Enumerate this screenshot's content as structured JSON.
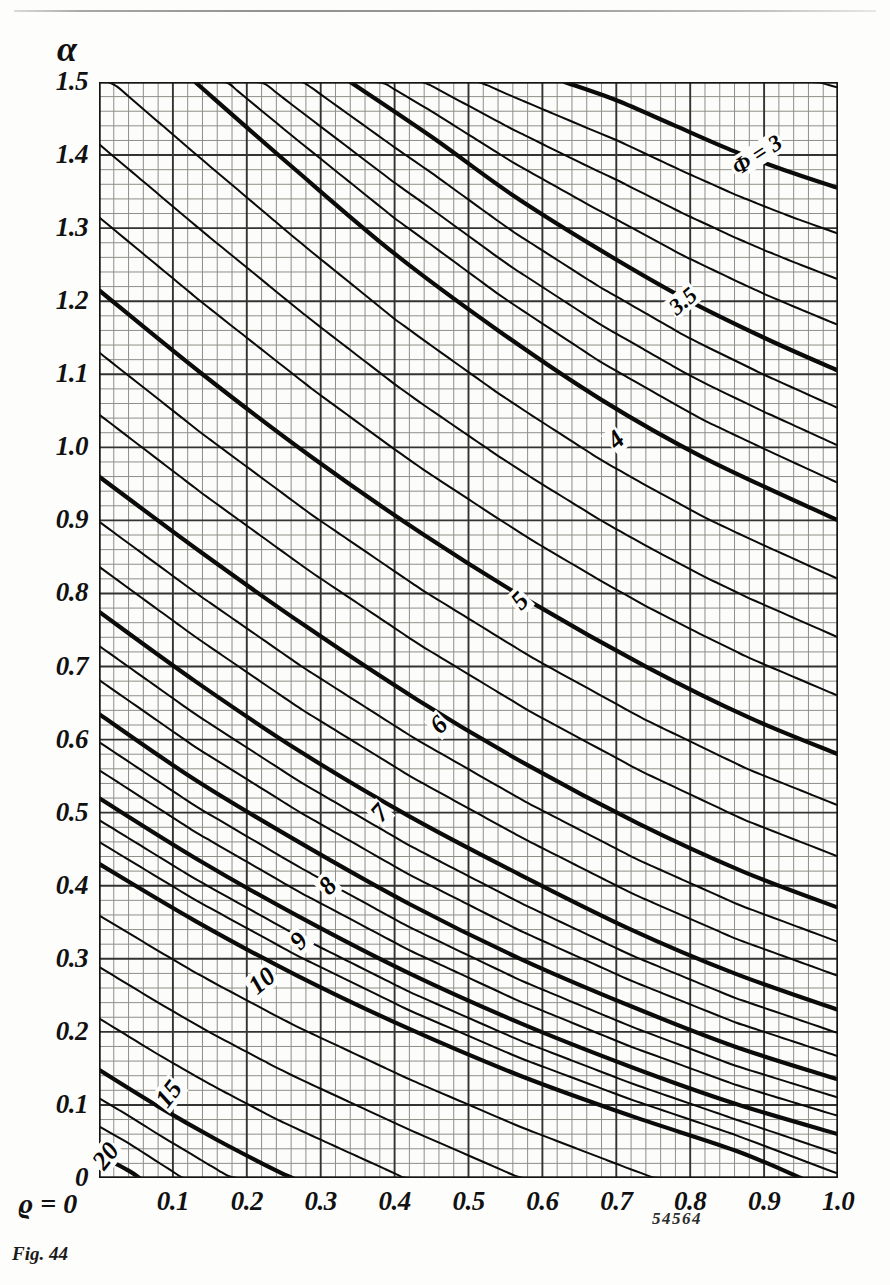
{
  "figure": {
    "caption": "Fig. 44",
    "serial_number": "54564"
  },
  "axes": {
    "y_symbol": "α",
    "x_symbol": "ϱ = 0",
    "x_label_prefix": "ϱ =",
    "y_ticks": [
      "0",
      "0.1",
      "0.2",
      "0.3",
      "0.4",
      "0.5",
      "0.6",
      "0.7",
      "0.8",
      "0.9",
      "1.0",
      "1.1",
      "1.2",
      "1.3",
      "1.4",
      "1.5"
    ],
    "x_ticks": [
      "0",
      "0.1",
      "0.2",
      "0.3",
      "0.4",
      "0.5",
      "0.6",
      "0.7",
      "0.8",
      "0.9",
      "1.0"
    ]
  },
  "chart_data": {
    "type": "line",
    "title": "Fig. 44",
    "xlabel": "ϱ",
    "ylabel": "α",
    "xlim": [
      0,
      1.0
    ],
    "ylim": [
      0,
      1.5
    ],
    "grid": true,
    "minor_grid": true,
    "minor_per_major": 5,
    "legend": "none",
    "contour_variable": "Φ",
    "annotations": [
      {
        "text": "Φ = 3",
        "x": 0.89,
        "y": 1.4,
        "rotation": -33
      },
      {
        "text": "3.5",
        "x": 0.79,
        "y": 1.2,
        "rotation": -40
      },
      {
        "text": "4",
        "x": 0.7,
        "y": 1.01,
        "rotation": -42
      },
      {
        "text": "5",
        "x": 0.57,
        "y": 0.79,
        "rotation": -45
      },
      {
        "text": "6",
        "x": 0.46,
        "y": 0.62,
        "rotation": -45
      },
      {
        "text": "7",
        "x": 0.38,
        "y": 0.5,
        "rotation": -48
      },
      {
        "text": "8",
        "x": 0.31,
        "y": 0.4,
        "rotation": -48
      },
      {
        "text": "9",
        "x": 0.27,
        "y": 0.325,
        "rotation": -48
      },
      {
        "text": "10",
        "x": 0.22,
        "y": 0.27,
        "rotation": -40
      },
      {
        "text": "15",
        "x": 0.095,
        "y": 0.115,
        "rotation": -52
      },
      {
        "text": "20",
        "x": 0.01,
        "y": 0.03,
        "rotation": -52
      }
    ],
    "labeled_contours": [
      {
        "label": "Φ = 3",
        "phi": 3,
        "points": [
          [
            0.63,
            1.5
          ],
          [
            0.7,
            1.475
          ],
          [
            0.78,
            1.44
          ],
          [
            0.86,
            1.405
          ],
          [
            0.94,
            1.375
          ],
          [
            1.0,
            1.355
          ]
        ]
      },
      {
        "label": "3.5",
        "phi": 3.5,
        "points": [
          [
            0.34,
            1.5
          ],
          [
            0.45,
            1.425
          ],
          [
            0.56,
            1.345
          ],
          [
            0.67,
            1.275
          ],
          [
            0.79,
            1.205
          ],
          [
            0.9,
            1.15
          ],
          [
            1.0,
            1.105
          ]
        ]
      },
      {
        "label": "4",
        "phi": 4,
        "points": [
          [
            0.13,
            1.5
          ],
          [
            0.26,
            1.385
          ],
          [
            0.4,
            1.265
          ],
          [
            0.54,
            1.16
          ],
          [
            0.68,
            1.065
          ],
          [
            0.82,
            0.985
          ],
          [
            1.0,
            0.9
          ]
        ]
      },
      {
        "label": "5",
        "phi": 5,
        "points": [
          [
            0.0,
            1.215
          ],
          [
            0.14,
            1.1
          ],
          [
            0.29,
            0.985
          ],
          [
            0.44,
            0.88
          ],
          [
            0.59,
            0.785
          ],
          [
            0.74,
            0.7
          ],
          [
            0.88,
            0.63
          ],
          [
            1.0,
            0.58
          ]
        ]
      },
      {
        "label": "6",
        "phi": 6,
        "points": [
          [
            0.0,
            0.96
          ],
          [
            0.14,
            0.855
          ],
          [
            0.28,
            0.755
          ],
          [
            0.43,
            0.655
          ],
          [
            0.58,
            0.565
          ],
          [
            0.73,
            0.485
          ],
          [
            0.87,
            0.42
          ],
          [
            1.0,
            0.37
          ]
        ]
      },
      {
        "label": "7",
        "phi": 7,
        "points": [
          [
            0.0,
            0.775
          ],
          [
            0.13,
            0.68
          ],
          [
            0.27,
            0.585
          ],
          [
            0.42,
            0.495
          ],
          [
            0.57,
            0.415
          ],
          [
            0.72,
            0.34
          ],
          [
            0.86,
            0.28
          ],
          [
            1.0,
            0.23
          ]
        ]
      },
      {
        "label": "8",
        "phi": 8,
        "points": [
          [
            0.0,
            0.635
          ],
          [
            0.13,
            0.545
          ],
          [
            0.27,
            0.46
          ],
          [
            0.42,
            0.375
          ],
          [
            0.57,
            0.3
          ],
          [
            0.72,
            0.235
          ],
          [
            0.86,
            0.18
          ],
          [
            1.0,
            0.135
          ]
        ]
      },
      {
        "label": "9",
        "phi": 9,
        "points": [
          [
            0.0,
            0.52
          ],
          [
            0.13,
            0.438
          ],
          [
            0.27,
            0.358
          ],
          [
            0.42,
            0.28
          ],
          [
            0.57,
            0.212
          ],
          [
            0.72,
            0.152
          ],
          [
            0.86,
            0.102
          ],
          [
            1.0,
            0.06
          ]
        ]
      },
      {
        "label": "10",
        "phi": 10,
        "points": [
          [
            0.0,
            0.43
          ],
          [
            0.13,
            0.352
          ],
          [
            0.27,
            0.276
          ],
          [
            0.42,
            0.204
          ],
          [
            0.57,
            0.14
          ],
          [
            0.72,
            0.085
          ],
          [
            0.86,
            0.038
          ],
          [
            0.95,
            0.0
          ]
        ]
      },
      {
        "label": "15",
        "phi": 15,
        "points": [
          [
            0.0,
            0.148
          ],
          [
            0.08,
            0.098
          ],
          [
            0.16,
            0.052
          ],
          [
            0.24,
            0.01
          ],
          [
            0.262,
            0.0
          ]
        ]
      },
      {
        "label": "20",
        "phi": 20,
        "points": [
          [
            0.0,
            0.032
          ],
          [
            0.04,
            0.01
          ],
          [
            0.055,
            0.0
          ]
        ]
      }
    ],
    "unlabeled_contours_note": "Intermediate thin curves of the same family are drawn between the labelled Φ curves."
  },
  "colors": {
    "ink": "#111111",
    "paper": "#fdfdfb",
    "grid_minor": "#8f8f88",
    "grid_major": "#333333",
    "contour": "#0b0b0b"
  }
}
